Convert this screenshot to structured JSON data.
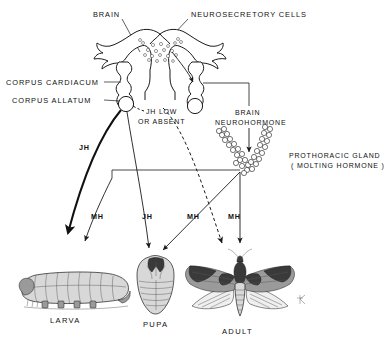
{
  "figure": {
    "background_color": "#ffffff",
    "ink_color": "#1a1a1a"
  },
  "labels": {
    "brain": "BRAIN",
    "neurosecretory_cells": "NEUROSECRETORY  CELLS",
    "corpus_cardiacum": "CORPUS  CARDIACUM",
    "corpus_allatum": "CORPUS  ALLATUM",
    "jh_low_line1": "JH  LOW",
    "jh_low_line2": "OR  ABSENT",
    "brain_neurohormone_line1": "BRAIN",
    "brain_neurohormone_line2": "NEUROHORMONE",
    "prothoracic_gland_line1": "PROTHORACIC  GLAND",
    "prothoracic_gland_line2": "( MOLTING  HORMONE )"
  },
  "hormone_arrows": [
    {
      "id": "jh-to-larva",
      "label": "JH",
      "style": "thick-solid",
      "target": "larva"
    },
    {
      "id": "mh-to-larva",
      "label": "MH",
      "style": "thin-solid",
      "target": "larva"
    },
    {
      "id": "jh-to-pupa",
      "label": "JH",
      "style": "thin-solid",
      "target": "pupa"
    },
    {
      "id": "mh-to-pupa",
      "label": "MH",
      "style": "thin-solid",
      "target": "pupa"
    },
    {
      "id": "jh-to-adult",
      "label": "",
      "style": "dashed",
      "target": "adult"
    },
    {
      "id": "mh-to-adult",
      "label": "MH",
      "style": "thin-solid",
      "target": "adult"
    }
  ],
  "stages": [
    {
      "id": "larva",
      "label": "LARVA"
    },
    {
      "id": "pupa",
      "label": "PUPA"
    },
    {
      "id": "adult",
      "label": "ADULT"
    }
  ]
}
